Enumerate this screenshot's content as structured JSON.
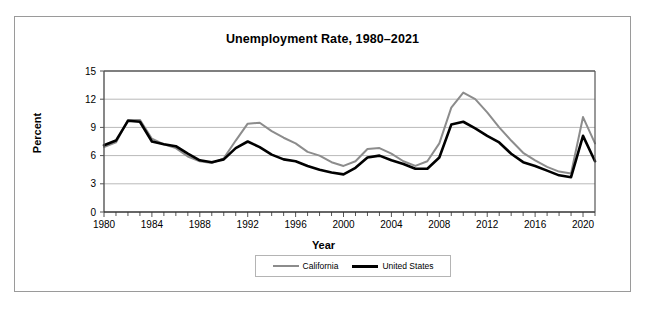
{
  "figure": {
    "title": "Unemployment Rate, 1980–2021",
    "frame_color": "#9a9a9a"
  },
  "axes": {
    "ylabel": "Percent",
    "xlabel": "Year",
    "y_ticks": [
      "0",
      "3",
      "6",
      "9",
      "12",
      "15"
    ],
    "x_ticks": [
      "1980",
      "1984",
      "1988",
      "1992",
      "1996",
      "2000",
      "2004",
      "2008",
      "2012",
      "2016",
      "2020"
    ]
  },
  "legend": {
    "items": [
      {
        "label": "California",
        "color": "#8c8c8c"
      },
      {
        "label": "United States",
        "color": "#000000"
      }
    ]
  },
  "chart_data": {
    "type": "line",
    "title": "Unemployment Rate, 1980–2021",
    "xlabel": "Year",
    "ylabel": "Percent",
    "xlim": [
      1980,
      2021
    ],
    "ylim": [
      0,
      15
    ],
    "ytick_values": [
      0,
      3,
      6,
      9,
      12,
      15
    ],
    "xtick_values": [
      1980,
      1984,
      1988,
      1992,
      1996,
      2000,
      2004,
      2008,
      2012,
      2016,
      2020
    ],
    "grid": "horizontal",
    "legend_position": "bottom",
    "x": [
      1980,
      1981,
      1982,
      1983,
      1984,
      1985,
      1986,
      1987,
      1988,
      1989,
      1990,
      1991,
      1992,
      1993,
      1994,
      1995,
      1996,
      1997,
      1998,
      1999,
      2000,
      2001,
      2002,
      2003,
      2004,
      2005,
      2006,
      2007,
      2008,
      2009,
      2010,
      2011,
      2012,
      2013,
      2014,
      2015,
      2016,
      2017,
      2018,
      2019,
      2020,
      2021
    ],
    "series": [
      {
        "name": "California",
        "color": "#8c8c8c",
        "values": [
          6.9,
          7.4,
          9.8,
          9.8,
          7.8,
          7.2,
          6.8,
          5.9,
          5.4,
          5.2,
          5.7,
          7.6,
          9.4,
          9.5,
          8.6,
          7.9,
          7.3,
          6.4,
          6.0,
          5.3,
          4.9,
          5.4,
          6.7,
          6.8,
          6.2,
          5.4,
          4.9,
          5.4,
          7.3,
          11.1,
          12.7,
          12.0,
          10.6,
          9.0,
          7.6,
          6.3,
          5.5,
          4.8,
          4.3,
          4.1,
          10.1,
          7.3
        ]
      },
      {
        "name": "United States",
        "color": "#000000",
        "values": [
          7.1,
          7.6,
          9.7,
          9.6,
          7.5,
          7.2,
          7.0,
          6.2,
          5.5,
          5.3,
          5.6,
          6.8,
          7.5,
          6.9,
          6.1,
          5.6,
          5.4,
          4.9,
          4.5,
          4.2,
          4.0,
          4.7,
          5.8,
          6.0,
          5.5,
          5.1,
          4.6,
          4.6,
          5.8,
          9.3,
          9.6,
          8.9,
          8.1,
          7.4,
          6.2,
          5.3,
          4.9,
          4.4,
          3.9,
          3.7,
          8.1,
          5.4
        ]
      }
    ]
  }
}
